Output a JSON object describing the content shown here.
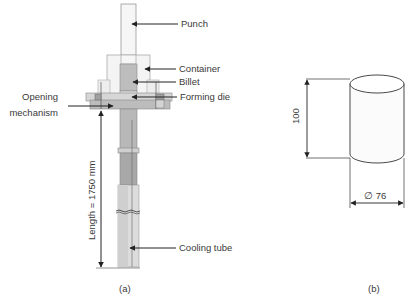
{
  "figure_a": {
    "caption": "(a)",
    "labels": {
      "punch": "Punch",
      "container": "Container",
      "billet": "Billet",
      "forming_die": "Forming die",
      "opening_mechanism_line1": "Opening",
      "opening_mechanism_line2": "mechanism",
      "length": "Length = 1750 mm",
      "cooling_tube": "Cooling tube"
    }
  },
  "figure_b": {
    "caption": "(b)",
    "height_dim": "100",
    "diameter_dim": "∅ 76"
  },
  "colors": {
    "line": "#333333",
    "light_fill": "#f2f2f2",
    "mid_fill": "#c8c8c8",
    "dark_fill": "#a8a8a8"
  }
}
